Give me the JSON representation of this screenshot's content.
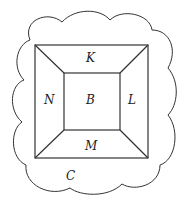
{
  "diagram": {
    "type": "region-diagram",
    "colors": {
      "stroke": "#333333",
      "background": "#ffffff"
    },
    "regions": {
      "top": "K",
      "left": "N",
      "center": "B",
      "right": "L",
      "bottom": "M",
      "outside": "C"
    }
  }
}
